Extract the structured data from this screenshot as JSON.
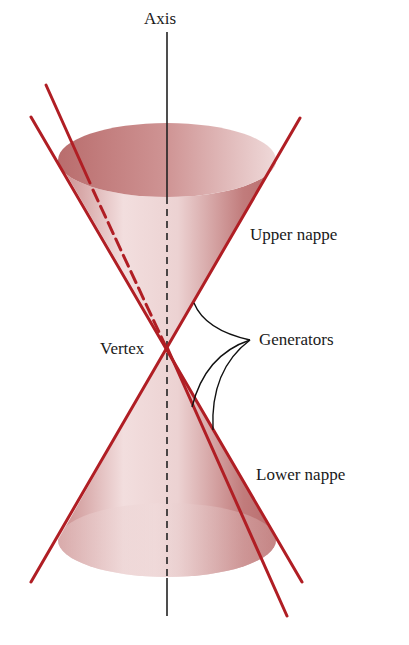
{
  "labels": {
    "axis": "Axis",
    "upper_nappe": "Upper nappe",
    "lower_nappe": "Lower nappe",
    "vertex": "Vertex",
    "generators": "Generators"
  },
  "colors": {
    "generator_line": "#b01e24",
    "cone_fill_dark": "#c07a7a",
    "cone_fill_light": "#f4e4e4",
    "axis_line": "#222222",
    "text": "#1a1a1a",
    "background": "#ffffff"
  },
  "geometry": {
    "vertex": [
      167,
      347
    ],
    "axis_top": [
      167,
      32
    ],
    "axis_bottom": [
      167,
      616
    ],
    "upper_rim_ellipse": {
      "cx": 167,
      "cy": 160,
      "rx": 109,
      "ry": 37
    },
    "lower_rim_ellipse": {
      "cx": 167,
      "cy": 540,
      "rx": 109,
      "ry": 37
    }
  }
}
